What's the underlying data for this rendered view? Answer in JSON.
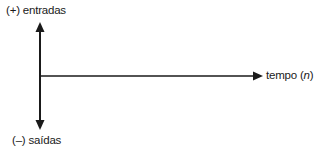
{
  "diagram": {
    "type": "cash-flow-axis",
    "vertical_axis": {
      "top_label": "(+) entradas",
      "bottom_label": "(–) saídas"
    },
    "horizontal_axis": {
      "label_prefix": "tempo (",
      "label_var": "n",
      "label_suffix": ")"
    },
    "colors": {
      "line": "#1a1a1a",
      "text": "#1a1a1a",
      "background": "#ffffff"
    }
  }
}
